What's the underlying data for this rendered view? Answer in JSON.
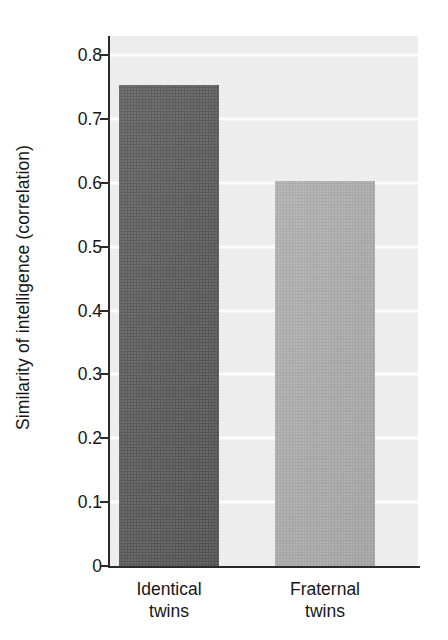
{
  "chart_data": {
    "type": "bar",
    "title": "",
    "subtitle": "",
    "xlabel": "",
    "ylabel": "Similarity of intelligence (correlation)",
    "categories": [
      "Identical\ntwins",
      "Fraternal\ntwins"
    ],
    "category_labels_flat": [
      "Identical twins",
      "Fraternal twins"
    ],
    "values": [
      0.754,
      0.603
    ],
    "ylim": [
      0,
      0.83
    ],
    "y_ticks": [
      0,
      0.1,
      0.2,
      0.3,
      0.4,
      0.5,
      0.6,
      0.7,
      0.8
    ],
    "y_tick_labels": [
      "0",
      "0.1",
      "0.2",
      "0.3",
      "0.4",
      "0.5",
      "0.6",
      "0.7",
      "0.8"
    ],
    "grid": true,
    "grid_axis": "y",
    "grid_color": "#fdfdfd",
    "legend": false,
    "legend_position": "none",
    "plot_background": "#ededed",
    "bar_colors": [
      "#555555",
      "#a6a6a6"
    ],
    "axis_color": "#2a2a2a",
    "series": [
      {
        "name": "Similarity of intelligence (correlation)",
        "values": [
          0.754,
          0.603
        ]
      }
    ]
  },
  "figure": {
    "background": "#ffffff",
    "caption_fragment": ""
  }
}
